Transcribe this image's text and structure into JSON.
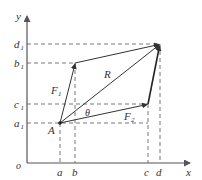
{
  "diagram": {
    "type": "vector-addition",
    "axes": {
      "x_label": "x",
      "y_label": "y",
      "origin_label": "o"
    },
    "x_ticks": [
      "a",
      "b",
      "c",
      "d"
    ],
    "y_ticks": [
      "a",
      "b",
      "c",
      "d"
    ],
    "y_tick_subscript": "1",
    "points": {
      "A": "A"
    },
    "vectors": {
      "F1": {
        "label": "F",
        "sub": "1"
      },
      "F2": {
        "label": "F",
        "sub": "2"
      },
      "R": {
        "label": "R"
      }
    },
    "angle_label": "θ"
  }
}
